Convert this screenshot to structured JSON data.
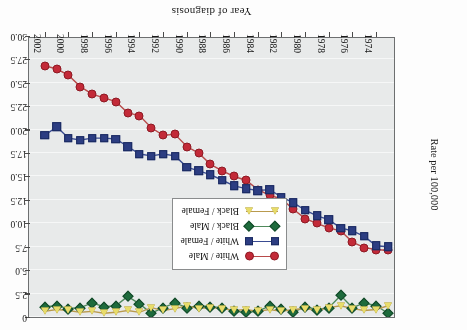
{
  "figure": {
    "orientation": "rotated-180",
    "x_axis_title": "Year of diagnosis",
    "y_axis_title": "Rate per 100,000"
  },
  "legend": {
    "items": [
      {
        "label": "White / Male",
        "marker": "circle",
        "color": "#c32a38",
        "line_color": "#b84a4a"
      },
      {
        "label": "White / Female",
        "marker": "square",
        "color": "#2c3d82",
        "line_color": "#3a4c92"
      },
      {
        "label": "Black / Male",
        "marker": "diamond",
        "color": "#1e6b3c",
        "line_color": "#4f8a5c"
      },
      {
        "label": "Black / Female",
        "marker": "triangle",
        "color": "#e8dc6a",
        "line_color": "#b99a4e"
      }
    ]
  },
  "chart_data": {
    "type": "line",
    "title": "",
    "xlabel": "Year of diagnosis",
    "ylabel": "Rate per 100,000",
    "xlim": [
      1973,
      2003
    ],
    "ylim": [
      0,
      30
    ],
    "ytick_labels": [
      "0",
      "2.5",
      "5.0",
      "7.5",
      "10.0",
      "12.5",
      "15.0",
      "17.5",
      "20.0",
      "22.5",
      "25.0",
      "27.5",
      "30.0"
    ],
    "ytick_values": [
      0,
      2.5,
      5.0,
      7.5,
      10.0,
      12.5,
      15.0,
      17.5,
      20.0,
      22.5,
      25.0,
      27.5,
      30.0
    ],
    "xtick_labels": [
      "1974",
      "1976",
      "1978",
      "1980",
      "1982",
      "1984",
      "1986",
      "1988",
      "1990",
      "1992",
      "1994",
      "1996",
      "1998",
      "2000",
      "2002"
    ],
    "xtick_values": [
      1974,
      1976,
      1978,
      1980,
      1982,
      1984,
      1986,
      1988,
      1990,
      1992,
      1994,
      1996,
      1998,
      2000,
      2002
    ],
    "grid": true,
    "legend_position": "inside-lower-right",
    "x": [
      1973,
      1974,
      1975,
      1976,
      1977,
      1978,
      1979,
      1980,
      1981,
      1982,
      1983,
      1984,
      1985,
      1986,
      1987,
      1988,
      1989,
      1990,
      1991,
      1992,
      1993,
      1994,
      1995,
      1996,
      1997,
      1998,
      1999,
      2000,
      2001,
      2002
    ],
    "series": [
      {
        "name": "White / Male",
        "marker": "circle",
        "color": "#c32a38",
        "values": [
          7.1,
          7.2,
          7.4,
          8.0,
          9.2,
          9.5,
          10.0,
          10.5,
          11.5,
          12.6,
          13.0,
          13.6,
          14.6,
          15.0,
          15.6,
          16.3,
          17.5,
          18.2,
          19.5,
          19.4,
          20.2,
          21.5,
          21.8,
          23.0,
          23.4,
          23.8,
          24.6,
          25.8,
          26.5,
          26.8
        ]
      },
      {
        "name": "White / Female",
        "marker": "square",
        "color": "#2c3d82",
        "values": [
          7.5,
          7.6,
          8.6,
          9.2,
          9.5,
          10.4,
          10.8,
          11.4,
          12.2,
          12.8,
          13.6,
          13.5,
          13.7,
          14.0,
          14.6,
          15.2,
          15.6,
          16.0,
          17.2,
          17.4,
          17.2,
          17.4,
          18.2,
          19.0,
          19.1,
          19.1,
          18.9,
          19.1,
          20.3,
          19.4
        ]
      },
      {
        "name": "Black / Male",
        "marker": "diamond",
        "color": "#1e6b3c",
        "values": [
          0.4,
          1.2,
          1.5,
          1.0,
          2.3,
          1.0,
          0.8,
          1.1,
          0.5,
          0.9,
          1.2,
          0.6,
          0.5,
          0.6,
          1.0,
          1.1,
          1.2,
          1.0,
          1.5,
          1.0,
          0.4,
          1.4,
          2.2,
          1.2,
          1.1,
          1.5,
          1.0,
          0.9,
          1.2,
          1.1
        ]
      },
      {
        "name": "Black / Female",
        "marker": "triangle",
        "color": "#e8dc6a",
        "values": [
          1.2,
          0.8,
          0.7,
          0.9,
          1.2,
          1.0,
          0.7,
          0.9,
          0.8,
          0.6,
          0.8,
          0.6,
          0.8,
          0.7,
          0.9,
          1.0,
          0.9,
          1.2,
          0.9,
          0.7,
          1.0,
          0.5,
          0.7,
          0.5,
          0.4,
          0.6,
          0.5,
          0.7,
          0.8,
          0.6
        ]
      }
    ]
  }
}
